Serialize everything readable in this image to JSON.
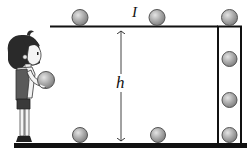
{
  "diagram": {
    "labels": {
      "shelf": "I",
      "height": "h"
    },
    "colors": {
      "ball_fill": "#a0a0a0",
      "ball_highlight": "#d8d8d8",
      "ball_stroke": "#555555",
      "line": "#111111",
      "background": "#ffffff"
    },
    "elements": {
      "shelf_balls": 2,
      "column_top_ball": 1,
      "column_inner_balls": 3,
      "floor_balls": 2,
      "figure": "girl holding ball"
    }
  }
}
